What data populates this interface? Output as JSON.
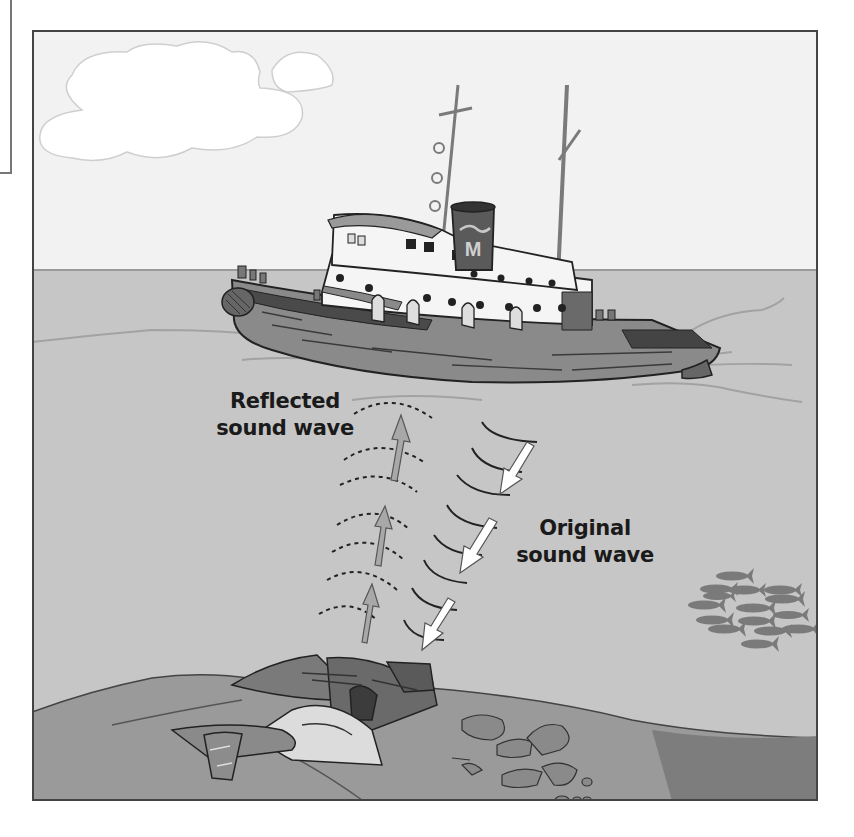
{
  "figure": {
    "type": "illustration",
    "labels": {
      "reflected": {
        "line1": "Reflected",
        "line2": "sound wave"
      },
      "original": {
        "line1": "Original",
        "line2": "sound wave"
      }
    },
    "funnel_logo": "M",
    "colors": {
      "sky": "#f2f2f2",
      "sea": "#c6c6c6",
      "seafloor": "#9a9a9a",
      "seafloor_dark": "#7d7d7d",
      "hull": "#8a8a8a",
      "cabin": "#f5f5f5",
      "funnel": "#5a5a5a",
      "reflected_arrow": "#a8a8a8",
      "original_arrow": "#ffffff",
      "wave_line": "#222222",
      "fish": "#7a7a7a",
      "frame": "#444444"
    },
    "elements": {
      "original_wave_arrows": 3,
      "reflected_wave_arrows": 3,
      "fish_in_school": 14,
      "clouds": 2
    }
  }
}
